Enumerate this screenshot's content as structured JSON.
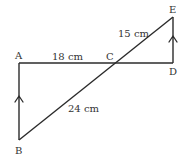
{
  "diagram": {
    "type": "geometry",
    "points": {
      "A": {
        "label": "A",
        "x": 19,
        "y": 63
      },
      "B": {
        "label": "B",
        "x": 19,
        "y": 140
      },
      "C": {
        "label": "C",
        "x": 113,
        "y": 63
      },
      "D": {
        "label": "D",
        "x": 173,
        "y": 63
      },
      "E": {
        "label": "E",
        "x": 173,
        "y": 17
      }
    },
    "measurements": {
      "AC": "18 cm",
      "CE": "15 cm",
      "BC": "24 cm"
    },
    "parallel_marks": [
      "AB",
      "DE"
    ],
    "colors": {
      "line": "#2b2b2b",
      "text": "#333333",
      "background": "#ffffff"
    }
  }
}
